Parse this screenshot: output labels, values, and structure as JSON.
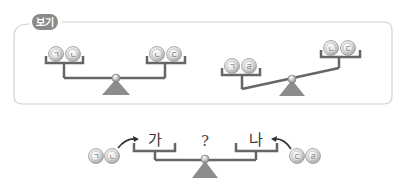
{
  "example_box": {
    "tag_label": "보기",
    "scales": [
      {
        "state": "balanced",
        "left_pan": [
          "ㄱ",
          "ㄴ"
        ],
        "right_pan": [
          "ㄴ",
          "ㄷ"
        ]
      },
      {
        "state": "right-side-heavier-down-left",
        "left_pan": [
          "ㄱ",
          "ㄹ"
        ],
        "right_pan": [
          "ㄴ",
          "ㄷ"
        ]
      }
    ]
  },
  "question_scale": {
    "left_pan_label": "가",
    "right_pan_label": "나",
    "center_label": "?",
    "left_balls": [
      "ㄱ",
      "ㄴ"
    ],
    "right_balls": [
      "ㄷ",
      "ㄹ"
    ]
  },
  "colors": {
    "beam": "#6b6b6b",
    "fulcrum": "#8c8c8c",
    "ball_fill": "#e6e6e6",
    "ball_ring": "#9a9a9a",
    "tag_fill": "#8a8a8a",
    "frame": "#cfcfcf"
  }
}
